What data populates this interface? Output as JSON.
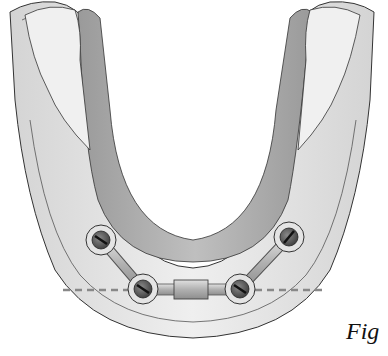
{
  "figure": {
    "caption": "Fig",
    "colors": {
      "background": "#ffffff",
      "outer_ridge": "#e6e6e6",
      "inner_band": "#a8a8a8",
      "gingiva": "#f2f2f2",
      "outline": "#333333",
      "implant_ring": "#e2e2e2",
      "implant_head": "#555555",
      "bar": "#bdbdbd",
      "reference_line": "#888888"
    },
    "implants": [
      {
        "id": "implant-1",
        "cx": 101,
        "cy": 240
      },
      {
        "id": "implant-2",
        "cx": 143,
        "cy": 289
      },
      {
        "id": "implant-3",
        "cx": 240,
        "cy": 289
      },
      {
        "id": "implant-4",
        "cx": 289,
        "cy": 237
      }
    ],
    "reference_line": {
      "y": 290,
      "x1": 63,
      "x2": 322,
      "style": "dashed"
    }
  }
}
